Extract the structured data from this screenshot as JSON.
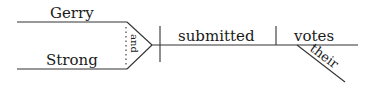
{
  "diagram": {
    "type": "sentence-diagram",
    "subjects": [
      "Gerry",
      "Strong"
    ],
    "conjunction": "and",
    "verb": "submitted",
    "object": "votes",
    "modifier": "their",
    "line_color": "#333333"
  }
}
